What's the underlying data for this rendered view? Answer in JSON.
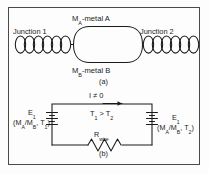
{
  "figure": {
    "panel_a": {
      "caption": "(a)",
      "junction_left_label": "Junction 1",
      "junction_right_label": "Junction 2",
      "metal_a_label": "Mₐ-metal A",
      "metal_a_symbol": "M",
      "metal_a_subscript": "A",
      "metal_a_rest": "-metal A",
      "metal_b_symbol": "M",
      "metal_b_subscript": "B",
      "metal_b_rest": "-metal B"
    },
    "panel_b": {
      "caption": "(b)",
      "current_label": "I ≠ 0",
      "temperature_relation": "T",
      "temp_sub_1": "1",
      "temp_mid": " > T",
      "temp_sub_2": "2",
      "resistor_symbol": "R",
      "resistor_subscript": "wire",
      "emf_left_symbol": "E",
      "emf_left_subscript": "1",
      "emf_left_detail_open": "(M",
      "emf_left_detail_suba": "A",
      "emf_left_detail_slash": "/M",
      "emf_left_detail_subb": "B",
      "emf_left_detail_comma": ", T",
      "emf_left_detail_subt": "1",
      "emf_left_detail_close": ")",
      "emf_right_symbol": "E",
      "emf_right_subscript": "1",
      "emf_right_detail_open": "(M",
      "emf_right_detail_suba": "A",
      "emf_right_detail_slash": "/M",
      "emf_right_detail_subb": "B",
      "emf_right_detail_comma": ", T",
      "emf_right_detail_subt": "2",
      "emf_right_detail_close": ")"
    },
    "colors": {
      "stroke": "#1a1a1a",
      "frame": "#4a4a4a",
      "background": "#fdfdfd"
    }
  }
}
